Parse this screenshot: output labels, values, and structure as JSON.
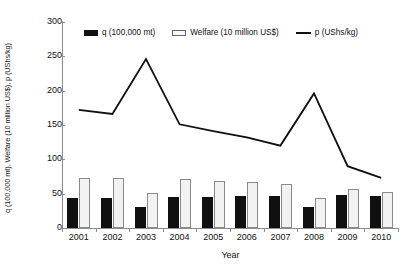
{
  "chart_data": {
    "type": "bar",
    "title": "",
    "xlabel": "Year",
    "ylabel": "q (100,000 mt), Welfare (10 million US$), p (UShs/kg)",
    "categories": [
      "2001",
      "2002",
      "2003",
      "2004",
      "2005",
      "2006",
      "2007",
      "2008",
      "2009",
      "2010"
    ],
    "ylim": [
      0,
      300
    ],
    "yticks": [
      0,
      50,
      100,
      150,
      200,
      250,
      300
    ],
    "grid": false,
    "legend_position": "top-center",
    "series": [
      {
        "name": "q (100,000 mt)",
        "kind": "bar",
        "color": "#101010",
        "values": [
          44,
          44,
          31,
          45,
          45,
          46,
          46,
          30,
          48,
          47
        ]
      },
      {
        "name": "Welfare (10 million US$)",
        "kind": "bar",
        "color": "#f2f2f2",
        "values": [
          73,
          73,
          51,
          71,
          69,
          67,
          64,
          43,
          57,
          53
        ]
      },
      {
        "name": "p (UShs/kg)",
        "kind": "line",
        "color": "#101010",
        "values": [
          172,
          166,
          246,
          151,
          141,
          132,
          120,
          196,
          90,
          73
        ]
      }
    ]
  },
  "legend": {
    "items": [
      {
        "label": "q (100,000 mt)",
        "marker": "filled-square"
      },
      {
        "label": "Welfare (10 million US$)",
        "marker": "open-square"
      },
      {
        "label": "p (UShs/kg)",
        "marker": "line"
      }
    ]
  },
  "axes": {
    "y_title": "q (100,000 mt), Welfare (10 million US$), p (UShs/kg)",
    "x_title": "Year"
  }
}
